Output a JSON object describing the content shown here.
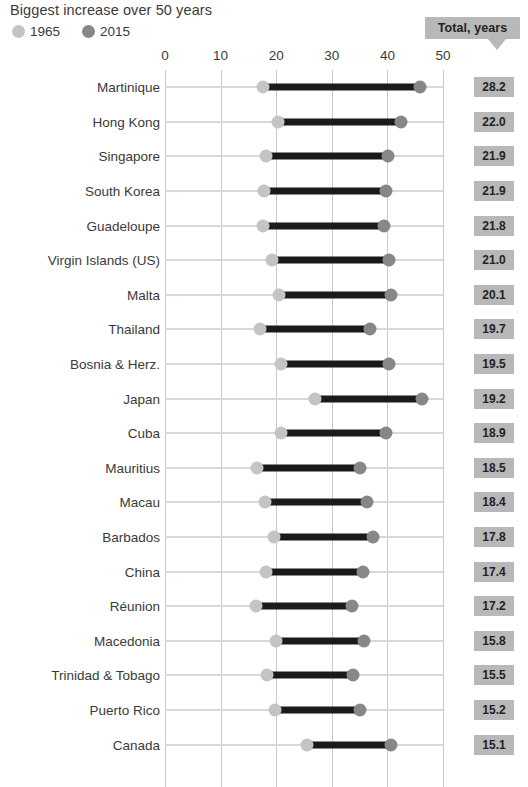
{
  "header": {
    "title": "Biggest increase over 50 years",
    "total_badge_label": "Total, years"
  },
  "legend": {
    "items": [
      {
        "label": "1965",
        "color": "#c4c4c4",
        "swatch_icon": "circle-icon"
      },
      {
        "label": "2015",
        "color": "#878787",
        "swatch_icon": "circle-icon"
      }
    ]
  },
  "chart_data": {
    "type": "bar",
    "subtype": "dumbbell",
    "title": "Biggest increase over 50 years",
    "xlabel": "",
    "ylabel": "",
    "xlim": [
      0,
      50
    ],
    "xticks": [
      0,
      10,
      20,
      30,
      40,
      50
    ],
    "xtick_labels": [
      "0",
      "10",
      "20",
      "30",
      "40",
      "50"
    ],
    "grid": true,
    "legend_position": "top-left",
    "value_column_header": "Total, years",
    "series": [
      {
        "name": "1965",
        "color": "#c4c4c4"
      },
      {
        "name": "2015",
        "color": "#878787"
      }
    ],
    "categories": [
      "Martinique",
      "Hong Kong",
      "Singapore",
      "South Korea",
      "Guadeloupe",
      "Virgin Islands (US)",
      "Malta",
      "Thailand",
      "Bosnia & Herz.",
      "Japan",
      "Cuba",
      "Mauritius",
      "Macau",
      "Barbados",
      "China",
      "Réunion",
      "Macedonia",
      "Trinidad & Tobago",
      "Puerto Rico",
      "Canada"
    ],
    "rows": [
      {
        "label": "Martinique",
        "v1965": 17.7,
        "v2015": 45.9,
        "total": "28.2"
      },
      {
        "label": "Hong Kong",
        "v1965": 20.4,
        "v2015": 42.4,
        "total": "22.0"
      },
      {
        "label": "Singapore",
        "v1965": 18.2,
        "v2015": 40.1,
        "total": "21.9"
      },
      {
        "label": "South Korea",
        "v1965": 17.8,
        "v2015": 39.7,
        "total": "21.9"
      },
      {
        "label": "Guadeloupe",
        "v1965": 17.6,
        "v2015": 39.4,
        "total": "21.8"
      },
      {
        "label": "Virgin Islands (US)",
        "v1965": 19.3,
        "v2015": 40.3,
        "total": "21.0"
      },
      {
        "label": "Malta",
        "v1965": 20.5,
        "v2015": 40.6,
        "total": "20.1"
      },
      {
        "label": "Thailand",
        "v1965": 17.1,
        "v2015": 36.8,
        "total": "19.7"
      },
      {
        "label": "Bosnia & Herz.",
        "v1965": 20.8,
        "v2015": 40.3,
        "total": "19.5"
      },
      {
        "label": "Japan",
        "v1965": 27.0,
        "v2015": 46.2,
        "total": "19.2"
      },
      {
        "label": "Cuba",
        "v1965": 20.9,
        "v2015": 39.8,
        "total": "18.9"
      },
      {
        "label": "Mauritius",
        "v1965": 16.6,
        "v2015": 35.1,
        "total": "18.5"
      },
      {
        "label": "Macau",
        "v1965": 18.0,
        "v2015": 36.4,
        "total": "18.4"
      },
      {
        "label": "Barbados",
        "v1965": 19.6,
        "v2015": 37.4,
        "total": "17.8"
      },
      {
        "label": "China",
        "v1965": 18.2,
        "v2015": 35.6,
        "total": "17.4"
      },
      {
        "label": "Réunion",
        "v1965": 16.4,
        "v2015": 33.6,
        "total": "17.2"
      },
      {
        "label": "Macedonia",
        "v1965": 20.0,
        "v2015": 35.8,
        "total": "15.8"
      },
      {
        "label": "Trinidad & Tobago",
        "v1965": 18.3,
        "v2015": 33.8,
        "total": "15.5"
      },
      {
        "label": "Puerto Rico",
        "v1965": 19.8,
        "v2015": 35.0,
        "total": "15.2"
      },
      {
        "label": "Canada",
        "v1965": 25.5,
        "v2015": 40.6,
        "total": "15.1"
      }
    ]
  }
}
